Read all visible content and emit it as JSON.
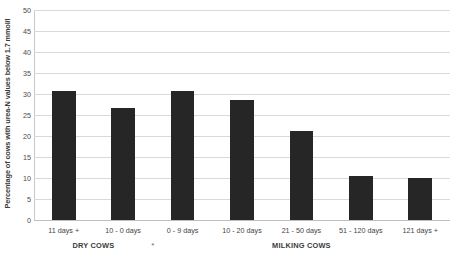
{
  "chart_data": {
    "type": "bar",
    "title": "",
    "xlabel": "",
    "ylabel": "Percentage of cows with urea-N values below 1.7 mmol/l",
    "ylim": [
      0,
      50
    ],
    "ytick_interval": 5,
    "yticks": [
      "50",
      "45",
      "40",
      "35",
      "30",
      "25",
      "20",
      "15",
      "10",
      "5",
      "0"
    ],
    "grid": "horizontal",
    "legend": "none",
    "bar_color": "#262626",
    "gridline_color": "#d9d9d9",
    "categories": [
      "11 days +",
      "10 - 0 days",
      "0 - 9 days",
      "10 - 20 days",
      "21 - 50 days",
      "51 - 120 days",
      "121 days +"
    ],
    "values": [
      30.7,
      26.7,
      30.7,
      28.6,
      21.1,
      10.5,
      10.0
    ],
    "groups": [
      {
        "label": "DRY COWS",
        "first_index": 0,
        "last_index": 1
      },
      {
        "label": "MILKING COWS",
        "first_index": 2,
        "last_index": 6
      }
    ],
    "annotations": [
      {
        "text": "*",
        "after_index": 1
      }
    ]
  }
}
